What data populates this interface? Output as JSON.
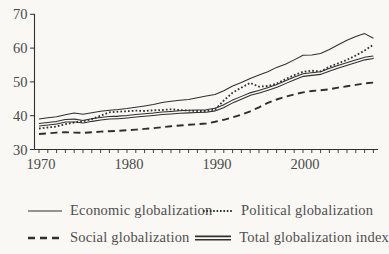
{
  "colors": {
    "background": "#f9f8f5",
    "ink": "#2f2f2f",
    "text": "#4a4a4a"
  },
  "chart_data": {
    "type": "line",
    "title": "",
    "xlabel": "",
    "ylabel": "",
    "ylim": [
      30,
      70
    ],
    "yticks": [
      30,
      40,
      50,
      60,
      70
    ],
    "xticks_labeled": [
      1970,
      1980,
      1990,
      2000
    ],
    "xtick_minor_every_years": 1,
    "grid": false,
    "legend_position": "bottom",
    "x_start": 1970,
    "x_end": 2008,
    "x": [
      1970,
      1971,
      1972,
      1973,
      1974,
      1975,
      1976,
      1977,
      1978,
      1979,
      1980,
      1981,
      1982,
      1983,
      1984,
      1985,
      1986,
      1987,
      1988,
      1989,
      1990,
      1991,
      1992,
      1993,
      1994,
      1995,
      1996,
      1997,
      1998,
      1999,
      2000,
      2001,
      2002,
      2003,
      2004,
      2005,
      2006,
      2007,
      2008
    ],
    "series": [
      {
        "name": "Economic globalization",
        "style": "solid-thin",
        "values": [
          39.0,
          39.4,
          39.7,
          40.3,
          40.8,
          40.4,
          40.9,
          41.3,
          41.6,
          41.8,
          42.1,
          42.5,
          42.9,
          43.3,
          43.9,
          44.3,
          44.6,
          44.8,
          45.3,
          45.8,
          46.3,
          47.4,
          48.8,
          49.8,
          51.0,
          52.0,
          53.0,
          54.3,
          55.2,
          56.5,
          57.9,
          58.0,
          58.4,
          59.6,
          61.0,
          62.3,
          63.4,
          64.3,
          62.9
        ]
      },
      {
        "name": "Political globalization",
        "style": "dotted",
        "values": [
          36.2,
          36.5,
          36.8,
          37.5,
          38.0,
          38.3,
          39.0,
          40.0,
          41.0,
          41.2,
          41.3,
          41.5,
          41.4,
          41.6,
          41.7,
          41.9,
          41.7,
          41.5,
          41.4,
          41.4,
          41.8,
          44.5,
          46.8,
          48.3,
          49.7,
          48.6,
          48.8,
          49.5,
          50.8,
          52.0,
          53.0,
          53.3,
          53.1,
          54.5,
          55.5,
          56.5,
          57.8,
          59.3,
          61.0
        ]
      },
      {
        "name": "Social globalization",
        "style": "dashed",
        "values": [
          34.6,
          34.8,
          35.0,
          35.1,
          35.0,
          34.9,
          35.1,
          35.3,
          35.4,
          35.5,
          35.7,
          35.9,
          36.1,
          36.3,
          36.6,
          36.9,
          37.1,
          37.3,
          37.5,
          37.7,
          38.2,
          38.8,
          39.5,
          40.3,
          41.3,
          42.5,
          43.8,
          44.8,
          45.6,
          46.3,
          46.9,
          47.3,
          47.5,
          47.8,
          48.3,
          48.7,
          49.1,
          49.6,
          49.8
        ]
      },
      {
        "name": "Total globalization index",
        "style": "double-solid",
        "values": [
          37.3,
          37.6,
          37.9,
          38.5,
          38.6,
          38.2,
          38.7,
          39.1,
          39.4,
          39.5,
          39.7,
          40.0,
          40.2,
          40.4,
          40.7,
          40.9,
          41.1,
          41.2,
          41.3,
          41.4,
          41.8,
          42.8,
          44.2,
          45.3,
          46.4,
          47.1,
          47.9,
          48.8,
          49.9,
          51.0,
          52.0,
          52.3,
          52.6,
          53.6,
          54.5,
          55.3,
          56.1,
          56.9,
          57.3
        ]
      }
    ]
  }
}
